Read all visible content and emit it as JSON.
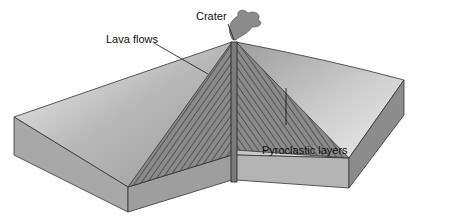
{
  "diagram": {
    "labels": {
      "crater": "Crater",
      "lava_flows": "Lava flows",
      "pyroclastic_layers": "Pyroclastic layers"
    }
  }
}
